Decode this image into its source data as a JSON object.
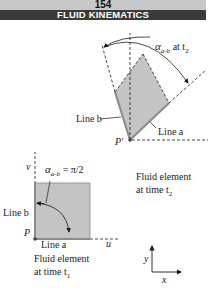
{
  "header": {
    "page_number": "154",
    "chapter_title": "FLUID KINEMATICS"
  },
  "figure": {
    "deformed_element": {
      "angle_label_main": "α",
      "angle_label_sub": "a-b",
      "angle_label_suffix": " at t",
      "angle_label_suffix_sub": "2",
      "line_b_label": "Line b",
      "line_a_label": "Line a",
      "point_label": "P′",
      "caption_line1": "Fluid element",
      "caption_line2": "at time t",
      "caption_sub": "2"
    },
    "original_element": {
      "v_axis_label": "v",
      "u_axis_label": "u",
      "angle_label_main": "α",
      "angle_label_sub": "a-b",
      "angle_label_value": " = π/2",
      "line_b_label": "Line b",
      "line_a_label": "Line a",
      "point_label": "P",
      "caption_line1": "Fluid element",
      "caption_line2": "at time t",
      "caption_sub": "1"
    },
    "coordinate_axes": {
      "y_label": "y",
      "x_label": "x"
    },
    "colors": {
      "fill": "#c4c4c4",
      "edge": "#8a8a8a",
      "ink": "#1a1a1a",
      "header_light": "#c8c8c8",
      "header_dark": "#3a3a3a"
    }
  }
}
